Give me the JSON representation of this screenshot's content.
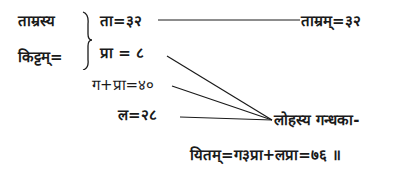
{
  "page": {
    "left_label_line1": "ताम्रस्य",
    "left_label_line2": "किट्टम्=",
    "bracket_item1": "ता=३२",
    "bracket_item2": "प्रा = ८",
    "item3": "ग+प्रा=४०",
    "item4": "ल=२८",
    "result_top": "ताम्रम्=३२",
    "result_lower_line1": "लोहस्य गन्धका-",
    "result_lower_line2": "यितम्=ग३प्रा+लप्रा=७६ ॥"
  },
  "colors": {
    "ink": "#1a1a1a",
    "background": "#ffffff"
  }
}
